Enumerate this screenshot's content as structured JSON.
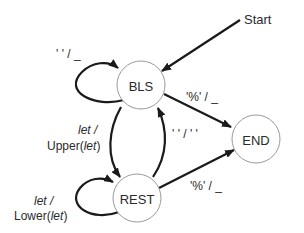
{
  "diagram": {
    "type": "finite-state-machine",
    "colors": {
      "edge": "#1a1a1a",
      "node_stroke": "#9a9a9a",
      "text": "#2a2a2a",
      "background": "#ffffff"
    },
    "start_label": "Start",
    "states": [
      {
        "id": "BLS",
        "label": "BLS"
      },
      {
        "id": "REST",
        "label": "REST"
      },
      {
        "id": "END",
        "label": "END"
      }
    ],
    "transitions": [
      {
        "from": "Start",
        "to": "BLS",
        "label": ""
      },
      {
        "from": "BLS",
        "to": "BLS",
        "label": "' ' / _"
      },
      {
        "from": "BLS",
        "to": "END",
        "label": "'%' / _"
      },
      {
        "from": "BLS",
        "to": "REST",
        "label_line1": "let /",
        "label_line2_pre": "Upper(",
        "label_line2_ital": "let",
        "label_line2_post": ")"
      },
      {
        "from": "REST",
        "to": "BLS",
        "label": "' ' / ' '"
      },
      {
        "from": "REST",
        "to": "REST",
        "label_line1": "let /",
        "label_line2_pre": "Lower(",
        "label_line2_ital": "let",
        "label_line2_post": ")"
      },
      {
        "from": "REST",
        "to": "END",
        "label": "'%' / _"
      }
    ]
  }
}
